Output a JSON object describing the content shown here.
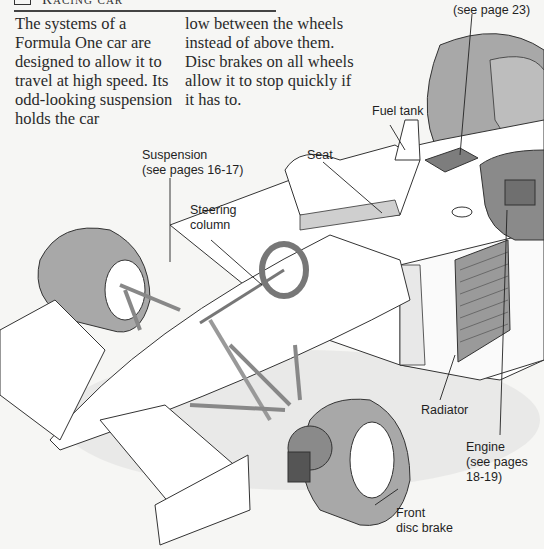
{
  "header": {
    "title": "Racing car",
    "icon": "box-outline-icon"
  },
  "intro": {
    "column1": "The systems of a Formula One car are designed to allow it to travel at high speed. Its odd-looking suspension holds the car",
    "column2": "low between the wheels instead of above them. Disc brakes on all wheels allow it to stop quickly if it has to."
  },
  "callouts": {
    "electronics": "(see page 23)",
    "fuel_tank": "Fuel tank",
    "suspension": "Suspension\n(see pages 16-17)",
    "seat": "Seat",
    "steering_column": "Steering\ncolumn",
    "radiator": "Radiator",
    "engine": "Engine\n(see pages\n18-19)",
    "front_disc_brake": "Front\ndisc brake"
  },
  "colors": {
    "background": "#f6f6f4",
    "tyre": "#a8a8a8",
    "body": "#ffffff",
    "shadow": "#d8d8d8",
    "line": "#333333"
  }
}
